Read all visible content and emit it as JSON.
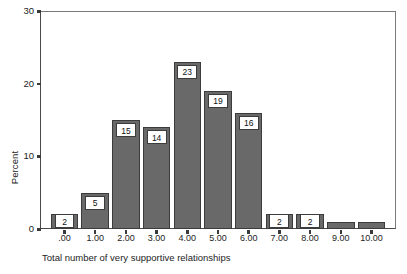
{
  "chart_data": {
    "type": "bar",
    "title": "",
    "subtitle": "",
    "xlabel": "Total number of very supportive relationships",
    "ylabel": "Percent",
    "categories": [
      ".00",
      "1.00",
      "2.00",
      "3.00",
      "4.00",
      "5.00",
      "6.00",
      "7.00",
      "8.00",
      "9.00",
      "10.00"
    ],
    "values": [
      2,
      5,
      15,
      14,
      23,
      19,
      16,
      2,
      2,
      1,
      1
    ],
    "data_labels": [
      "2",
      "5",
      "15",
      "14",
      "23",
      "19",
      "16",
      "2",
      "2",
      "",
      ""
    ],
    "ylim": [
      0,
      30
    ],
    "y_ticks": [
      "0",
      "10",
      "20",
      "30"
    ],
    "y_tick_values": [
      0,
      10,
      20,
      30
    ],
    "grid": false,
    "legend": false,
    "bar_color": "#696969",
    "bar_edge_color": "#3c3c3c",
    "label_box_fill": "#ffffff",
    "label_box_border": "#3c3c3c",
    "axis_color": "#4a4a4a",
    "frame_color": "#7a7a7a",
    "text_color": "#1d1d1d"
  }
}
